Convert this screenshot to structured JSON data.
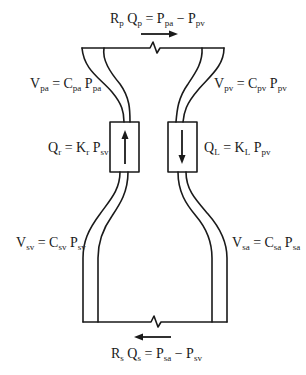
{
  "diagram": {
    "stroke_color": "#1a1a1a",
    "labels": {
      "pulmonary_resistance": {
        "parts": [
          "R",
          "p",
          " Q",
          "p",
          " = P",
          "pa",
          " − P",
          "pv"
        ]
      },
      "pulmonary_arterial_volume": {
        "parts": [
          "V",
          "pa",
          " = C",
          "pa",
          " P",
          "pa"
        ]
      },
      "pulmonary_venous_volume": {
        "parts": [
          "V",
          "pv",
          " = C",
          "pv",
          " P",
          "pv"
        ]
      },
      "right_heart_flow": {
        "parts": [
          "Q",
          "r",
          " = K",
          "r",
          " P",
          "sv"
        ]
      },
      "left_heart_flow": {
        "parts": [
          "Q",
          "L",
          " = K",
          "L",
          " P",
          "pv"
        ]
      },
      "systemic_venous_volume": {
        "parts": [
          "V",
          "sv",
          " = C",
          "sv",
          " P",
          "sv"
        ]
      },
      "systemic_arterial_volume": {
        "parts": [
          "V",
          "sa",
          " = C",
          "sa",
          " P",
          "sa"
        ]
      },
      "systemic_resistance": {
        "parts": [
          "R",
          "s",
          " Q",
          "s",
          " = P",
          "sa",
          " − P",
          "sv"
        ]
      }
    },
    "flow_arrows": {
      "pulmonary": "right",
      "systemic": "left",
      "right_heart": "up",
      "left_heart": "down"
    }
  }
}
